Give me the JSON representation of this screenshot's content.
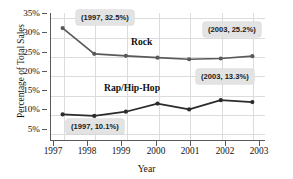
{
  "chart_data": {
    "type": "line",
    "title": "",
    "xlabel": "Year",
    "ylabel": "Percentage of Total Sales",
    "categories": [
      "1997",
      "1998",
      "1999",
      "2000",
      "2001",
      "2002",
      "2003"
    ],
    "x": [
      1997,
      1998,
      1999,
      2000,
      2001,
      2002,
      2003
    ],
    "xlim": [
      1996.6,
      2003.4
    ],
    "ylim": [
      3.2,
      36.4
    ],
    "yticks": [
      5,
      10,
      15,
      20,
      25,
      30,
      35
    ],
    "ytick_labels": [
      "5%",
      "10%",
      "15%",
      "20%",
      "25%",
      "30%",
      "35%"
    ],
    "grid": true,
    "legend_position": "inline-labels",
    "series": [
      {
        "name": "Rock",
        "color": "#595959",
        "values": [
          32.5,
          25.8,
          25.3,
          24.8,
          24.4,
          24.6,
          25.2
        ]
      },
      {
        "name": "Rap/Hip-Hop",
        "color": "#2b2b2b",
        "values": [
          10.1,
          9.7,
          10.8,
          12.9,
          11.4,
          13.8,
          13.3
        ]
      }
    ],
    "annotations": [
      {
        "id": "rock-1997",
        "text": "(1997, 32.5%)",
        "series": "Rock",
        "x": 1997,
        "y": 32.5
      },
      {
        "id": "rock-2003",
        "text": "(2003, 25.2%)",
        "series": "Rock",
        "x": 2003,
        "y": 25.2
      },
      {
        "id": "rap-2003",
        "text": "(2003, 13.3%)",
        "series": "Rap/Hip-Hop",
        "x": 2003,
        "y": 13.3
      },
      {
        "id": "rap-1997",
        "text": "(1997, 10.1%)",
        "series": "Rap/Hip-Hop",
        "x": 1997,
        "y": 10.1
      }
    ]
  },
  "colors": {
    "rock_line": "#595959",
    "rap_line": "#2b2b2b",
    "grid": "#dcdcdc",
    "axis": "#5a5a5a",
    "callout_bg": "#e3e3e3",
    "text": "#111111",
    "background": "#ffffff"
  }
}
